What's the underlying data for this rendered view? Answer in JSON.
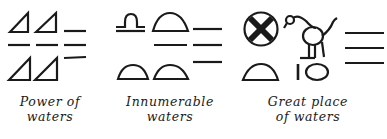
{
  "figure": {
    "groups": [
      {
        "id": "power-of-waters",
        "glyphs": [
          "triangle",
          "triangle",
          "water-line",
          "water-line",
          "water-line",
          "water-line",
          "triangle",
          "triangle",
          "water-line"
        ],
        "caption": {
          "line1": "Power of",
          "line2": "waters"
        }
      },
      {
        "id": "innumerable-waters",
        "glyphs": [
          "libra-glyph",
          "dome",
          "water-line",
          "water-line",
          "water-line",
          "water-line",
          "dome",
          "dome"
        ],
        "caption": {
          "line1": "Innumerable",
          "line2": "waters"
        }
      },
      {
        "id": "great-place-of-waters",
        "glyphs": [
          "cross-circle",
          "bird",
          "water-line",
          "water-line",
          "water-line",
          "dome",
          "vertical-bar",
          "oval"
        ],
        "caption": {
          "line1": "Great place",
          "line2": "of waters"
        }
      }
    ],
    "ink_color": "#1a1a1a",
    "background": "#ffffff"
  }
}
